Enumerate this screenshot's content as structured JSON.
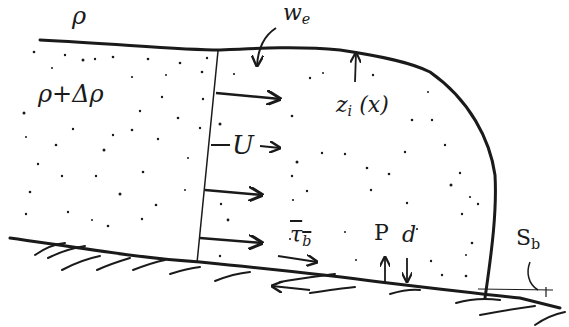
{
  "diagram": {
    "labels": {
      "ambient_density": "ρ",
      "entrainment": "w",
      "entrainment_sub": "e",
      "current_density": "ρ+Δρ",
      "velocity": "U",
      "interface_height": "z",
      "interface_height_sub": "i",
      "interface_height_arg": "(x)",
      "bed_stress": "τ",
      "bed_stress_sub": "b",
      "deposition_P": "P",
      "deposition_d": "d",
      "slope": "S",
      "slope_sub": "b"
    },
    "colors": {
      "ink": "#1a1a1a",
      "background": "#ffffff"
    }
  }
}
